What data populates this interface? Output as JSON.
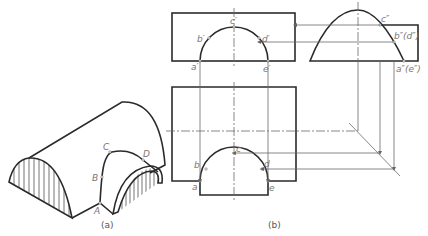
{
  "figure": {
    "subfigure_a": {
      "caption": "(a)",
      "labels": {
        "A": "A",
        "B": "B",
        "C": "C",
        "D": "D"
      }
    },
    "subfigure_b": {
      "caption": "(b)",
      "front_view_labels": {
        "a": "a′",
        "b": "b′",
        "c": "c′",
        "d": "d′",
        "e": "e′"
      },
      "side_view_labels": {
        "c": "c″",
        "bd": "b″(d″)",
        "ae": "a″(e″)"
      },
      "top_view_labels": {
        "a": "a",
        "b": "b",
        "c": "c",
        "d": "d",
        "e": "e"
      }
    }
  },
  "colors": {
    "outline": "#2a2a2a",
    "construction": "#6a6a6a",
    "label": "#777777"
  }
}
